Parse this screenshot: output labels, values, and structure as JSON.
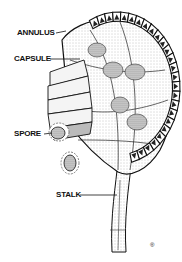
{
  "diagram": {
    "labels": {
      "annulus": "ANNULUS",
      "capsule": "CAPSULE",
      "spore": "SPORE",
      "stalk": "STALK"
    },
    "colors": {
      "ink": "#111111",
      "paper": "#ffffff",
      "stipple": "#d8d8d8"
    }
  }
}
